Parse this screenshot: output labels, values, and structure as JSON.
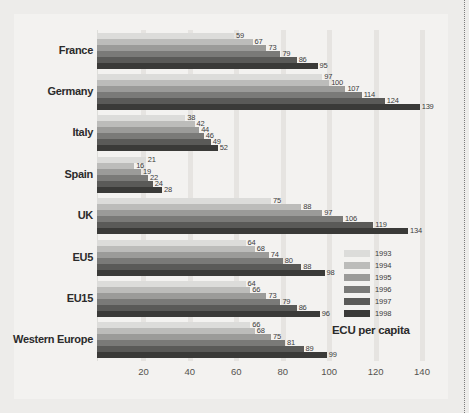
{
  "chart_data": {
    "type": "bar",
    "orientation": "horizontal",
    "title": "",
    "xlabel": "ECU per capita",
    "ylabel": "",
    "xlim": [
      0,
      140
    ],
    "xticks": [
      20,
      40,
      60,
      80,
      100,
      120,
      140
    ],
    "grid": true,
    "legend_position": "right",
    "categories": [
      "France",
      "Germany",
      "Italy",
      "Spain",
      "UK",
      "EU5",
      "EU15",
      "Western Europe"
    ],
    "series": [
      {
        "name": "1993",
        "color": "#dcdcda",
        "values": [
          59,
          97,
          38,
          21,
          75,
          64,
          64,
          66
        ]
      },
      {
        "name": "1994",
        "color": "#bcbcba",
        "values": [
          67,
          100,
          42,
          16,
          88,
          68,
          66,
          68
        ]
      },
      {
        "name": "1995",
        "color": "#9b9b99",
        "values": [
          73,
          107,
          44,
          19,
          97,
          74,
          73,
          75
        ]
      },
      {
        "name": "1996",
        "color": "#7a7a78",
        "values": [
          79,
          114,
          46,
          22,
          106,
          80,
          79,
          81
        ]
      },
      {
        "name": "1997",
        "color": "#5a5a58",
        "values": [
          86,
          124,
          49,
          24,
          119,
          88,
          86,
          89
        ]
      },
      {
        "name": "1998",
        "color": "#3a3a38",
        "values": [
          95,
          139,
          52,
          28,
          134,
          98,
          96,
          99
        ]
      }
    ]
  },
  "legend": {
    "items": [
      {
        "label": "1993"
      },
      {
        "label": "1994"
      },
      {
        "label": "1995"
      },
      {
        "label": "1996"
      },
      {
        "label": "1997"
      },
      {
        "label": "1998"
      }
    ]
  },
  "unit_label": "ECU per capita",
  "colors": {
    "page_background": "#edecea",
    "panel_background": "#f3f2f0",
    "gridline": "#e6e4e1",
    "text": "#2b2b2b"
  }
}
